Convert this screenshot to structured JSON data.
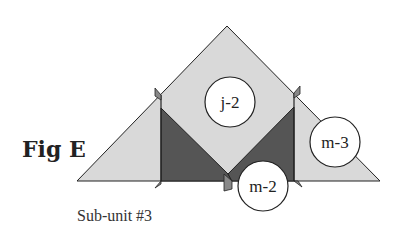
{
  "figure": {
    "title": "Fig E",
    "caption": "Sub-unit #3",
    "labels": {
      "top": "j-2",
      "right": "m-3",
      "bottom": "m-2"
    },
    "colors": {
      "light_fill": "#d9d9d9",
      "dark_fill": "#555555",
      "stroke": "#222222",
      "circle_fill": "#ffffff"
    }
  }
}
